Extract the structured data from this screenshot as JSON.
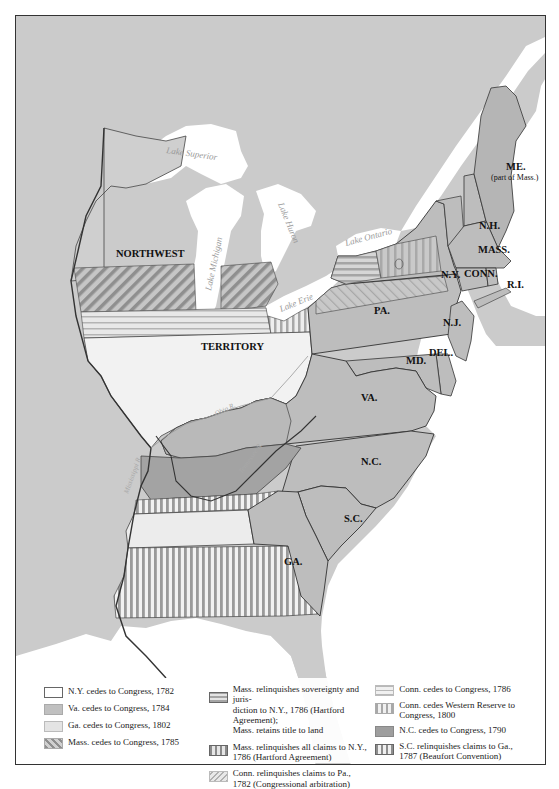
{
  "colors": {
    "land_background": "#cbcbcb",
    "water": "#ffffff",
    "ny_cession": "#f2f2f2",
    "va_cession": "#bdbdbd",
    "ga_cession": "#e3e3e3",
    "nc_cession": "#a3a3a3",
    "states": "#b8b8b8",
    "border": "#444444",
    "hatch_stroke": "#8e8e8e"
  },
  "map": {
    "regions": {
      "northwest": "NORTHWEST",
      "territory": "TERRITORY"
    },
    "states": [
      {
        "id": "me",
        "label": "ME.",
        "sub": "(part of Mass.)"
      },
      {
        "id": "nh",
        "label": "N.H."
      },
      {
        "id": "mass",
        "label": "MASS."
      },
      {
        "id": "conn",
        "label": "CONN."
      },
      {
        "id": "ri",
        "label": "R.I."
      },
      {
        "id": "ny",
        "label": "N.Y."
      },
      {
        "id": "nj",
        "label": "N.J."
      },
      {
        "id": "pa",
        "label": "PA."
      },
      {
        "id": "del",
        "label": "DEL."
      },
      {
        "id": "md",
        "label": "MD."
      },
      {
        "id": "va",
        "label": "VA."
      },
      {
        "id": "nc",
        "label": "N.C."
      },
      {
        "id": "sc",
        "label": "S.C."
      },
      {
        "id": "ga",
        "label": "GA."
      }
    ],
    "water_labels": {
      "lake_superior": "Lake Superior",
      "lake_michigan": "Lake Michigan",
      "lake_huron": "Lake Huron",
      "lake_erie": "Lake Erie",
      "lake_ontario": "Lake Ontario",
      "ohio_river": "Ohio R.",
      "mississippi_river": "Mississippi R.",
      "tennessee_river": "Tennessee R."
    }
  },
  "legend": {
    "items": [
      {
        "id": "ny",
        "swatch": "solid-white",
        "text": "N.Y. cedes to Congress, 1782"
      },
      {
        "id": "va",
        "swatch": "solid-mid-gray",
        "text": "Va. cedes to Congress, 1784"
      },
      {
        "id": "ga",
        "swatch": "solid-light-gray",
        "text": "Ga. cedes to Congress, 1802"
      },
      {
        "id": "mass",
        "swatch": "diagonal-hatch",
        "text": "Mass. cedes to Congress, 1785"
      },
      {
        "id": "mass-sov",
        "swatch": "horizontal-stripes",
        "text": "Mass. relinquishes sovereignty and juris-\ndiction to N.Y., 1786 (Hartford Agreement);\nMass. retains title to land"
      },
      {
        "id": "mass-ny",
        "swatch": "vertical-stripes",
        "text": "Mass. relinquishes all claims to N.Y.,\n1786 (Hartford Agreement)"
      },
      {
        "id": "conn-pa",
        "swatch": "diagonal-light",
        "text": "Conn. relinquishes claims to Pa.,\n1782 (Congressional arbitration)"
      },
      {
        "id": "conn",
        "swatch": "horizontal-light",
        "text": "Conn. cedes to Congress, 1786"
      },
      {
        "id": "conn-wr",
        "swatch": "vertical-light",
        "text": "Conn. cedes Western Reserve to\nCongress, 1800"
      },
      {
        "id": "nc",
        "swatch": "solid-dark-gray",
        "text": "N.C. cedes to Congress, 1790"
      },
      {
        "id": "sc",
        "swatch": "vertical-bold",
        "text": "S.C. relinquishes claims to Ga.,\n1787 (Beaufort Convention)"
      }
    ]
  }
}
